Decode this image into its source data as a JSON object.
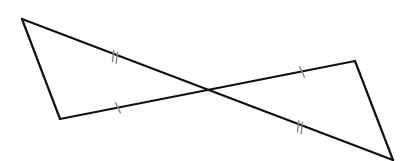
{
  "diagram": {
    "colors": {
      "line": "#111111",
      "tick": "#8a8a8a",
      "background": "#ffffff"
    },
    "points": {
      "A": {
        "x": 22,
        "y": 19
      },
      "B": {
        "x": 60,
        "y": 119
      },
      "O": {
        "x": 206,
        "y": 90
      },
      "C": {
        "x": 355,
        "y": 61
      },
      "D": {
        "x": 393,
        "y": 160
      }
    },
    "segments": [
      {
        "from": "A",
        "to": "B"
      },
      {
        "from": "A",
        "to": "D"
      },
      {
        "from": "B",
        "to": "C"
      },
      {
        "from": "C",
        "to": "D"
      }
    ],
    "tick_marks": [
      {
        "segment": "A-O",
        "count": 2,
        "at": {
          "x": 115,
          "y": 57
        }
      },
      {
        "segment": "O-D",
        "count": 2,
        "at": {
          "x": 300,
          "y": 127
        }
      },
      {
        "segment": "B-O",
        "count": 1,
        "at": {
          "x": 118,
          "y": 108
        }
      },
      {
        "segment": "O-C",
        "count": 1,
        "at": {
          "x": 302,
          "y": 72
        }
      }
    ]
  }
}
